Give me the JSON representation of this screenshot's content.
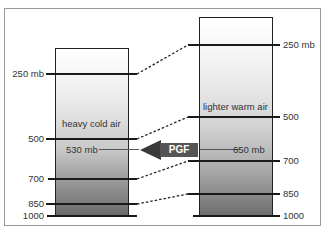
{
  "diagram": {
    "type": "pressure-gradient-force illustration",
    "left_column": {
      "label": "heavy cold air",
      "levels": [
        "250 mb",
        "500",
        "700",
        "850",
        "1000"
      ],
      "reference_pressure": "530 mb"
    },
    "right_column": {
      "label": "lighter warm air",
      "levels": [
        "250 mb",
        "500",
        "700",
        "850",
        "1000"
      ],
      "reference_pressure": "650 mb"
    },
    "arrow": {
      "label": "PGF",
      "direction": "left",
      "color": "#555555"
    },
    "colors": {
      "line": "#1a1a1a",
      "frame": "#9a9a9a"
    }
  }
}
